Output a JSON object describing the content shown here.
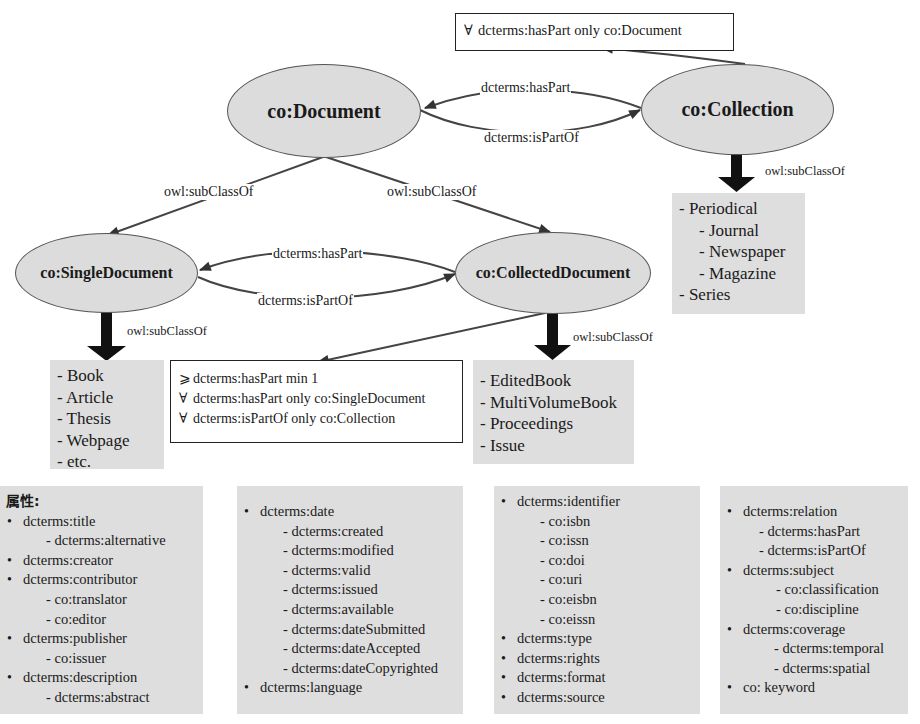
{
  "nodes": {
    "document": "co:Document",
    "collection": "co:Collection",
    "single_document": "co:SingleDocument",
    "collected_document": "co:CollectedDocument"
  },
  "edges": {
    "doc_collection_haspart": "dcterms:hasPart",
    "doc_collection_ispartof": "dcterms:isPartOf",
    "doc_single_subclass": "owl:subClassOf",
    "doc_collected_subclass": "owl:subClassOf",
    "single_collected_haspart": "dcterms:hasPart",
    "single_collected_ispartof": "dcterms:isPartOf",
    "collection_subclass": "owl:subClassOf",
    "single_subclass": "owl:subClassOf",
    "collected_subclass": "owl:subClassOf"
  },
  "constraints": {
    "collection": [
      {
        "symbol": "∀",
        "text": "dcterms:hasPart  only co:Document"
      }
    ],
    "collected_document": [
      {
        "symbol": "⩾",
        "text": "dcterms:hasPart  min 1"
      },
      {
        "symbol": "∀",
        "text": "dcterms:hasPart only co:SingleDocument"
      },
      {
        "symbol": "∀",
        "text": "dcterms:isPartOf only co:Collection"
      }
    ]
  },
  "subclasses": {
    "collection": [
      {
        "level": 1,
        "label": "- Periodical"
      },
      {
        "level": 2,
        "label": "- Journal"
      },
      {
        "level": 2,
        "label": "- Newspaper"
      },
      {
        "level": 2,
        "label": "- Magazine"
      },
      {
        "level": 1,
        "label": "- Series"
      }
    ],
    "single_document": [
      {
        "level": 1,
        "label": "- Book"
      },
      {
        "level": 1,
        "label": "- Article"
      },
      {
        "level": 1,
        "label": "- Thesis"
      },
      {
        "level": 1,
        "label": "- Webpage"
      },
      {
        "level": 1,
        "label": "- etc."
      }
    ],
    "collected_document": [
      {
        "level": 1,
        "label": "- EditedBook"
      },
      {
        "level": 1,
        "label": "- MultiVolumeBook"
      },
      {
        "level": 1,
        "label": "- Proceedings"
      },
      {
        "level": 1,
        "label": "- Issue"
      }
    ]
  },
  "properties": {
    "heading": "属性:",
    "panels": [
      [
        {
          "level": 1,
          "label": "dcterms:title"
        },
        {
          "level": 2,
          "label": "dcterms:alternative"
        },
        {
          "level": 1,
          "label": "dcterms:creator"
        },
        {
          "level": 1,
          "label": "dcterms:contributor"
        },
        {
          "level": 2,
          "label": "co:translator"
        },
        {
          "level": 2,
          "label": "co:editor"
        },
        {
          "level": 1,
          "label": "dcterms:publisher"
        },
        {
          "level": 2,
          "label": "co:issuer"
        },
        {
          "level": 1,
          "label": "dcterms:description"
        },
        {
          "level": 2,
          "label": "dcterms:abstract"
        }
      ],
      [
        {
          "level": 1,
          "label": "dcterms:date"
        },
        {
          "level": 2,
          "label": "dcterms:created"
        },
        {
          "level": 2,
          "label": "dcterms:modified"
        },
        {
          "level": 2,
          "label": "dcterms:valid"
        },
        {
          "level": 2,
          "label": "dcterms:issued"
        },
        {
          "level": 2,
          "label": "dcterms:available"
        },
        {
          "level": 2,
          "label": "dcterms:dateSubmitted"
        },
        {
          "level": 2,
          "label": "dcterms:dateAccepted"
        },
        {
          "level": 2,
          "label": "dcterms:dateCopyrighted"
        },
        {
          "level": 1,
          "label": "dcterms:language"
        }
      ],
      [
        {
          "level": 1,
          "label": "dcterms:identifier"
        },
        {
          "level": 2,
          "label": "co:isbn"
        },
        {
          "level": 2,
          "label": "co:issn"
        },
        {
          "level": 2,
          "label": "co:doi"
        },
        {
          "level": 2,
          "label": "co:uri"
        },
        {
          "level": 2,
          "label": "co:eisbn"
        },
        {
          "level": 2,
          "label": "co:eissn"
        },
        {
          "level": 1,
          "label": "dcterms:type"
        },
        {
          "level": 1,
          "label": "dcterms:rights"
        },
        {
          "level": 1,
          "label": "dcterms:format"
        },
        {
          "level": 1,
          "label": "dcterms:source"
        }
      ],
      [
        {
          "level": 1,
          "label": "dcterms:relation"
        },
        {
          "level": 2,
          "label": "dcterms:hasPart"
        },
        {
          "level": 2,
          "label": "dcterms:isPartOf"
        },
        {
          "level": 1,
          "label": "dcterms:subject"
        },
        {
          "level": 2,
          "label": "co:classification"
        },
        {
          "level": 2,
          "label": "co:discipline"
        },
        {
          "level": 1,
          "label": "dcterms:coverage"
        },
        {
          "level": 2,
          "label": "dcterms:temporal"
        },
        {
          "level": 2,
          "label": "dcterms:spatial"
        },
        {
          "level": 1,
          "label": "co: keyword"
        }
      ]
    ]
  },
  "colors": {
    "node_fill": "#dcdcdc",
    "panel_fill": "#dedede",
    "edge": "#444444"
  }
}
